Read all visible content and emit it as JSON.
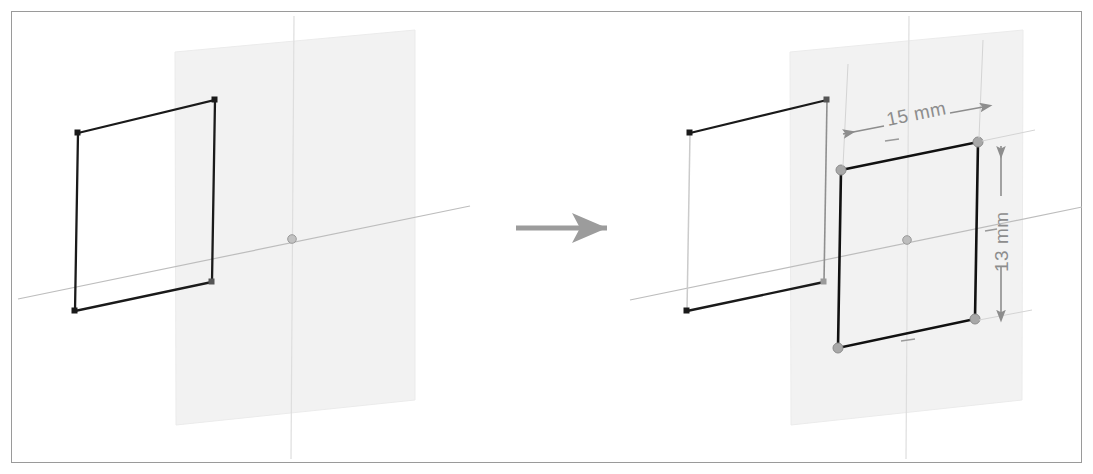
{
  "figure": {
    "title_visible": false,
    "background_color": "#ffffff",
    "frame_color": "#9a9a9a",
    "panels": [
      {
        "id": "before",
        "name": "before-state",
        "label": "",
        "sketch_plane": {
          "fill": "#f2f2f2",
          "stroke": "#e8e8e8"
        },
        "rectangle": {
          "name": "original-rectangle",
          "stroke": "#1a1a1a",
          "vertices": [
            [
              78,
              133
            ],
            [
              215,
              100
            ],
            [
              212,
              282
            ],
            [
              75,
              311
            ]
          ]
        },
        "axes": {
          "horizontal_color": "#b9b9b9",
          "vertical_color": "#dcdcdc",
          "origin": [
            292,
            239
          ]
        }
      },
      {
        "id": "after",
        "name": "after-state",
        "label": "",
        "sketch_plane": {
          "fill": "#f2f2f2",
          "stroke": "#e8e8e8"
        },
        "old_rectangle": {
          "name": "reference-rectangle",
          "stroke": "#1a1a1a",
          "faded_stroke": "#c9c9c9",
          "vertices": [
            [
              690,
              133
            ],
            [
              827,
              100
            ],
            [
              824,
              282
            ],
            [
              687,
              311
            ]
          ]
        },
        "new_rectangle": {
          "name": "dimensioned-rectangle",
          "stroke": "#111111",
          "vertices": [
            [
              841,
              170
            ],
            [
              978,
              142
            ],
            [
              975,
              319
            ],
            [
              838,
              348
            ]
          ],
          "handle_color": "#9e9e9e"
        },
        "axes": {
          "horizontal_color": "#b9b9b9",
          "vertical_color": "#dcdcdc",
          "origin": [
            907,
            240
          ]
        }
      }
    ],
    "transition_arrow": {
      "name": "transition-arrow",
      "color": "#9c9c9c",
      "from": [
        515,
        228
      ],
      "to": [
        620,
        228
      ]
    },
    "dimensions": [
      {
        "id": "width",
        "name": "width-dimension",
        "value": "15 mm",
        "orientation": "horizontal",
        "color": "#8d8d8d",
        "line_from": [
          841,
          133
        ],
        "line_to": [
          980,
          105
        ]
      },
      {
        "id": "height",
        "name": "height-dimension",
        "value": "13 mm",
        "orientation": "vertical",
        "color": "#8d8d8d",
        "line_from": [
          1001,
          145
        ],
        "line_to": [
          1001,
          314
        ]
      }
    ]
  }
}
